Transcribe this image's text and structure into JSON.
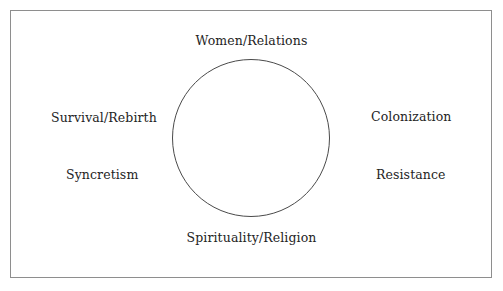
{
  "figure": {
    "background_color": "#ffffff",
    "frame_color": "#8e8e8e",
    "circle_color": "#4a4a4a",
    "text_color": "#242424"
  },
  "diagram": {
    "center_shape": "empty-circle",
    "labels": {
      "top": "Women/Relations",
      "bottom": "Spirituality/Religion",
      "left_upper": "Survival/Rebirth",
      "left_lower": "Syncretism",
      "right_upper": "Colonization",
      "right_lower": "Resistance"
    }
  }
}
